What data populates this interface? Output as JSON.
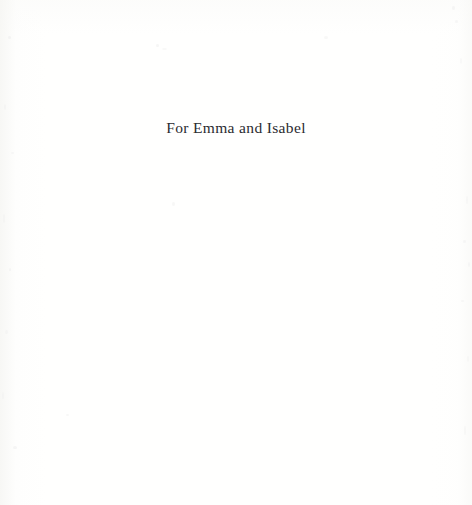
{
  "page": {
    "type": "book-dedication-page",
    "background_color": "#ffffff",
    "text_color": "#2b2b30"
  },
  "dedication": {
    "text": "For Emma and Isabel"
  },
  "artifacts": {
    "specks": [
      {
        "x": 8,
        "y": 36,
        "w": 3,
        "h": 3,
        "opacity": 0.55
      },
      {
        "x": 4,
        "y": 104,
        "w": 2,
        "h": 6,
        "opacity": 0.4
      },
      {
        "x": 11,
        "y": 152,
        "w": 3,
        "h": 2,
        "opacity": 0.45
      },
      {
        "x": 3,
        "y": 214,
        "w": 2,
        "h": 9,
        "opacity": 0.35
      },
      {
        "x": 9,
        "y": 268,
        "w": 2,
        "h": 3,
        "opacity": 0.5
      },
      {
        "x": 5,
        "y": 330,
        "w": 3,
        "h": 4,
        "opacity": 0.4
      },
      {
        "x": 2,
        "y": 392,
        "w": 2,
        "h": 7,
        "opacity": 0.35
      },
      {
        "x": 13,
        "y": 446,
        "w": 4,
        "h": 3,
        "opacity": 0.5
      },
      {
        "x": 66,
        "y": 414,
        "w": 3,
        "h": 2,
        "opacity": 0.45
      },
      {
        "x": 156,
        "y": 44,
        "w": 3,
        "h": 3,
        "opacity": 0.5
      },
      {
        "x": 162,
        "y": 48,
        "w": 5,
        "h": 2,
        "opacity": 0.35
      },
      {
        "x": 172,
        "y": 202,
        "w": 3,
        "h": 4,
        "opacity": 0.45
      },
      {
        "x": 324,
        "y": 36,
        "w": 4,
        "h": 3,
        "opacity": 0.4
      },
      {
        "x": 452,
        "y": 6,
        "w": 3,
        "h": 4,
        "opacity": 0.5
      },
      {
        "x": 455,
        "y": 20,
        "w": 3,
        "h": 3,
        "opacity": 0.45
      },
      {
        "x": 460,
        "y": 58,
        "w": 2,
        "h": 6,
        "opacity": 0.35
      },
      {
        "x": 466,
        "y": 196,
        "w": 2,
        "h": 8,
        "opacity": 0.35
      },
      {
        "x": 463,
        "y": 240,
        "w": 3,
        "h": 3,
        "opacity": 0.45
      },
      {
        "x": 468,
        "y": 262,
        "w": 2,
        "h": 5,
        "opacity": 0.4
      },
      {
        "x": 461,
        "y": 300,
        "w": 3,
        "h": 2,
        "opacity": 0.45
      },
      {
        "x": 467,
        "y": 356,
        "w": 2,
        "h": 6,
        "opacity": 0.35
      },
      {
        "x": 464,
        "y": 426,
        "w": 2,
        "h": 9,
        "opacity": 0.35
      }
    ]
  }
}
